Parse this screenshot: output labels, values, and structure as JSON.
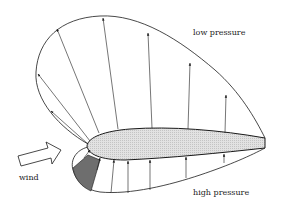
{
  "diagram": {
    "labels": {
      "low": "low pressure",
      "high": "high pressure",
      "wind": "wind"
    },
    "colors": {
      "airfoil_fill": "#dcdcdc",
      "stagnation_fill": "#6e6e6e",
      "stroke": "#1a1a1a",
      "wind_arrow_fill": "#ffffff"
    },
    "elements": {
      "upper_arrow_count": 7,
      "lower_arrow_count": 7
    }
  }
}
